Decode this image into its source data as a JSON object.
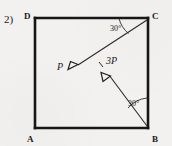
{
  "problem": {
    "number": "2)"
  },
  "figure": {
    "shape_name": "square",
    "corners": [
      {
        "id": "D",
        "label": "D",
        "x": 35,
        "y": 18
      },
      {
        "id": "C",
        "label": "C",
        "x": 148,
        "y": 18
      },
      {
        "id": "B",
        "label": "B",
        "x": 148,
        "y": 128
      },
      {
        "id": "A",
        "label": "A",
        "x": 35,
        "y": 128
      }
    ],
    "forces": [
      {
        "id": "P",
        "label": "P",
        "angle_label": "30°",
        "origin_corner": "C",
        "direction": "down-left",
        "start_x": 147,
        "start_y": 20,
        "end_x": 76,
        "end_y": 66
      },
      {
        "id": "3P",
        "label": "3P",
        "angle_label": "30°",
        "origin_corner": "B",
        "direction": "up-left",
        "start_x": 147,
        "start_y": 126,
        "end_x": 110,
        "end_y": 76
      }
    ],
    "colors": {
      "ink": "#161616",
      "line": "#2a2a2a",
      "background": "#f2f1ef"
    }
  }
}
